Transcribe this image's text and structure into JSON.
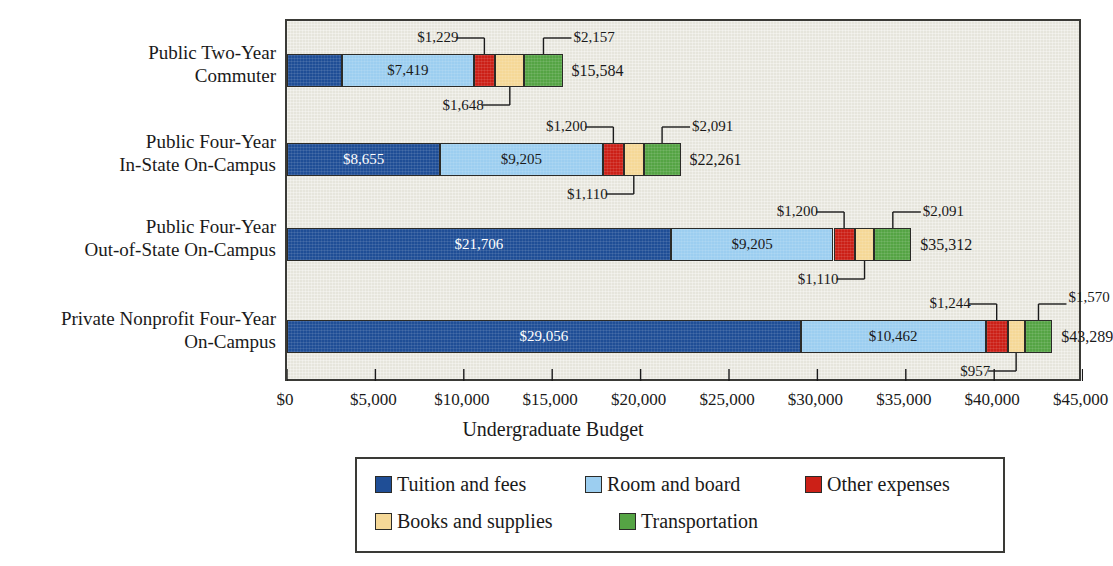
{
  "chart_data": {
    "type": "bar",
    "orientation": "horizontal",
    "stacked": true,
    "title": "",
    "xlabel": "Undergraduate Budget",
    "ylabel": "",
    "xlim": [
      0,
      45000
    ],
    "xtick_labels": [
      "$0",
      "$5,000",
      "$10,000",
      "$15,000",
      "$20,000",
      "$25,000",
      "$30,000",
      "$35,000",
      "$40,000",
      "$45,000"
    ],
    "xtick_values": [
      0,
      5000,
      10000,
      15000,
      20000,
      25000,
      30000,
      35000,
      40000,
      45000
    ],
    "grid": false,
    "legend_position": "bottom",
    "categories": [
      "Public Two-Year\nCommuter",
      "Public Four-Year\nIn-State On-Campus",
      "Public Four-Year\nOut-of-State On-Campus",
      "Private Nonprofit Four-Year\nOn-Campus"
    ],
    "series": [
      {
        "name": "Tuition and fees",
        "color": "#1f4e96",
        "values": [
          3131,
          8655,
          21706,
          29056
        ]
      },
      {
        "name": "Room and board",
        "color": "#9ccef0",
        "values": [
          7419,
          9205,
          9205,
          10462
        ]
      },
      {
        "name": "Other expenses",
        "color": "#cc2017",
        "values": [
          1229,
          1200,
          1200,
          1244
        ]
      },
      {
        "name": "Books and supplies",
        "color": "#f5d897",
        "values": [
          1648,
          1110,
          1110,
          957
        ]
      },
      {
        "name": "Transportation",
        "color": "#55a444",
        "values": [
          2157,
          2091,
          2091,
          1570
        ]
      }
    ],
    "totals": [
      15584,
      22261,
      35312,
      43289
    ],
    "total_labels": [
      "$15,584",
      "$22,261",
      "$35,312",
      "$43,289"
    ],
    "segment_labels": [
      [
        "$3,131",
        "$7,419",
        "$1,229",
        "$1,648",
        "$2,157"
      ],
      [
        "$8,655",
        "$9,205",
        "$1,200",
        "$1,110",
        "$2,091"
      ],
      [
        "$21,706",
        "$9,205",
        "$1,200",
        "$1,110",
        "$2,091"
      ],
      [
        "$29,056",
        "$10,462",
        "$1,244",
        "$957",
        "$1,570"
      ]
    ]
  },
  "axis": {
    "title": "Undergraduate Budget",
    "ticks": [
      "$0",
      "$5,000",
      "$10,000",
      "$15,000",
      "$20,000",
      "$25,000",
      "$30,000",
      "$35,000",
      "$40,000",
      "$45,000"
    ]
  },
  "categories": [
    {
      "line1": "Public Two-Year",
      "line2": "Commuter"
    },
    {
      "line1": "Public Four-Year",
      "line2": "In-State On-Campus"
    },
    {
      "line1": "Public Four-Year",
      "line2": "Out-of-State On-Campus"
    },
    {
      "line1": "Private Nonprofit Four-Year",
      "line2": "On-Campus"
    }
  ],
  "legend": {
    "items": [
      {
        "label": "Tuition and fees",
        "color": "#1f4e96"
      },
      {
        "label": "Room and board",
        "color": "#9ccef0"
      },
      {
        "label": "Other expenses",
        "color": "#cc2017"
      },
      {
        "label": "Books and supplies",
        "color": "#f5d897"
      },
      {
        "label": "Transportation",
        "color": "#55a444"
      }
    ]
  },
  "colors": {
    "plot_background": "#e6e5dc",
    "page_background": "#ffffff",
    "axis_line": "#3a3a36",
    "text": "#1a1a1a"
  }
}
